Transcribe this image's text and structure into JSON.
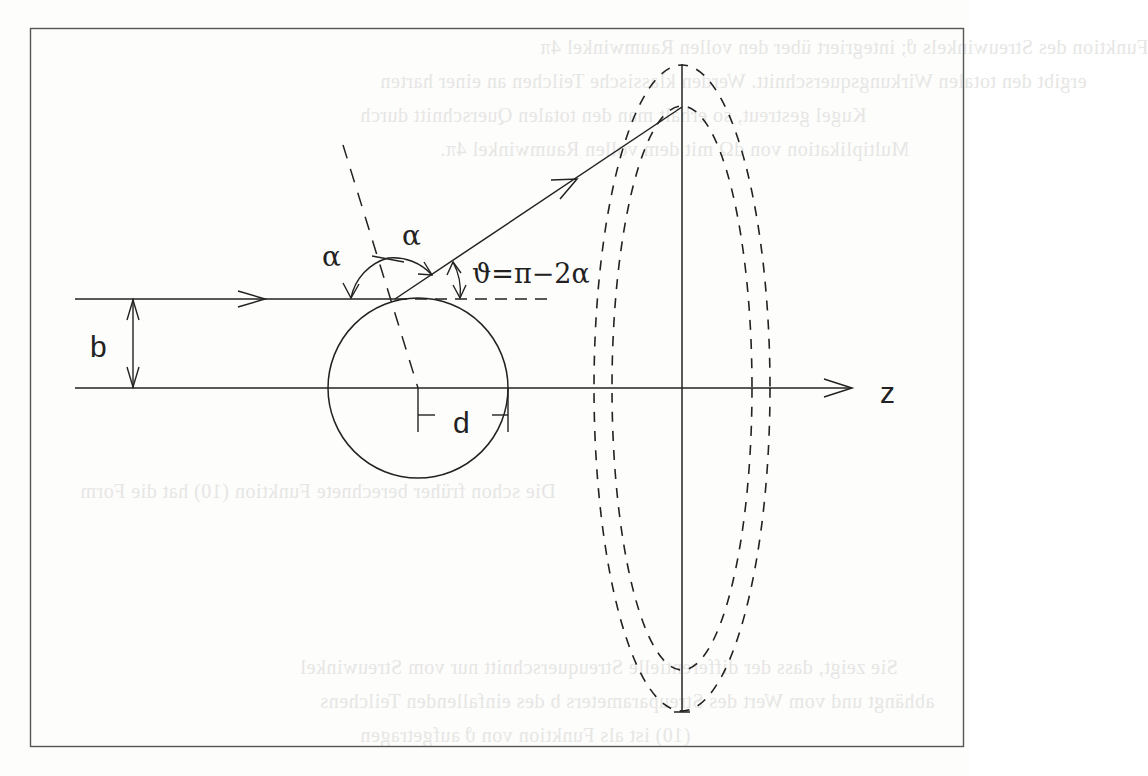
{
  "figure": {
    "type": "scattering-geometry-diagram",
    "labels": {
      "impact_parameter": "b",
      "distance": "d",
      "axis": "z",
      "angle_incident": "α",
      "angle_reflected": "α",
      "scattering_angle": "ϑ=π−2α"
    },
    "elements": [
      "incoming-ray",
      "scattered-ray",
      "z-axis",
      "scattering-sphere",
      "surface-normal",
      "detector-ellipse-outer",
      "detector-ellipse-inner",
      "detector-plane-line"
    ]
  },
  "colors": {
    "ink": "#222222",
    "frame": "#555555",
    "background": "#fdfdfc",
    "showthrough": "#e6e6e4"
  },
  "showthrough_text": [
    "Funktion des Streuwinkels ϑ; integriert über den vollen Raumwinkel 4π",
    "ergibt den totalen Wirkungsquerschnitt. Werden klassische Teilchen an einer harten",
    "Kugel gestreut, so erhält man den totalen Querschnitt durch",
    "Multiplikation von dΩ mit dem vollen Raumwinkel 4π.",
    "Die schon früher berechnete Funktion (10) hat die Form",
    "Sie zeigt, dass der differentielle Streuquerschnitt nur vom Streuwinkel",
    "abhängt und vom Wert des Streuparameters b des einfallenden Teilchens",
    "(10) ist als Funktion von ϑ aufgetragen"
  ]
}
